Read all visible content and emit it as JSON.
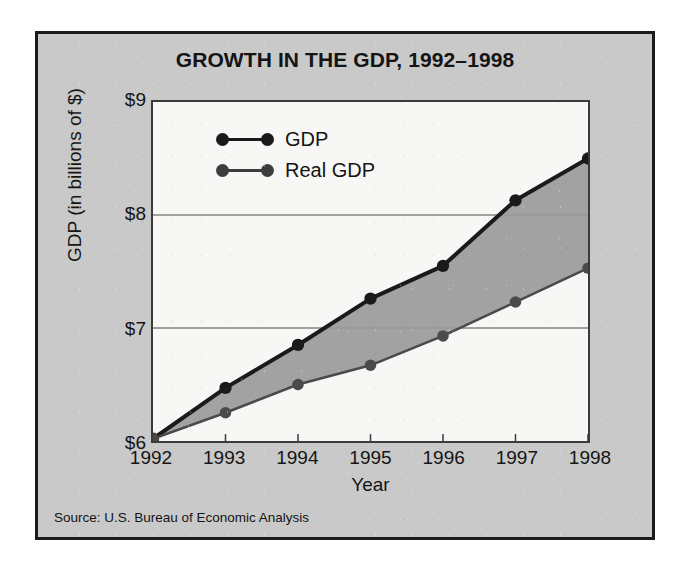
{
  "figure": {
    "title": "GROWTH IN THE GDP, 1992–1998",
    "source_note": "Source: U.S. Bureau of Economic Analysis",
    "panel_bg": "#c9c9c9",
    "plot_bg": "#f7f7f5",
    "border_color": "#1b1b1b"
  },
  "chart_data": {
    "type": "line",
    "title": "GROWTH IN THE GDP, 1992–1998",
    "xlabel": "Year",
    "ylabel": "GDP (in billions of $)",
    "categories": [
      "1992",
      "1993",
      "1994",
      "1995",
      "1996",
      "1997",
      "1998"
    ],
    "x": [
      1992,
      1993,
      1994,
      1995,
      1996,
      1997,
      1998
    ],
    "xlim": [
      1992,
      1998
    ],
    "ylim": [
      6,
      9
    ],
    "yticks": [
      6,
      7,
      8,
      9
    ],
    "ytick_labels": [
      "$6",
      "$7",
      "$8",
      "$9"
    ],
    "grid": "horizontal",
    "legend_position": "upper-left-inside",
    "fill_between_series": true,
    "fill_color": "#9a9a9a",
    "series": [
      {
        "name": "GDP",
        "color": "#1a1a1a",
        "line_width": 4,
        "values": [
          6.02,
          6.47,
          6.85,
          7.26,
          7.55,
          8.13,
          8.5
        ]
      },
      {
        "name": "Real GDP",
        "color": "#4a4a4a",
        "line_width": 2.5,
        "values": [
          6.02,
          6.25,
          6.5,
          6.67,
          6.93,
          7.23,
          7.53
        ]
      }
    ]
  },
  "legend": {
    "items": [
      {
        "label": "GDP",
        "color": "#1a1a1a"
      },
      {
        "label": "Real GDP",
        "color": "#3d3d3d"
      }
    ]
  }
}
